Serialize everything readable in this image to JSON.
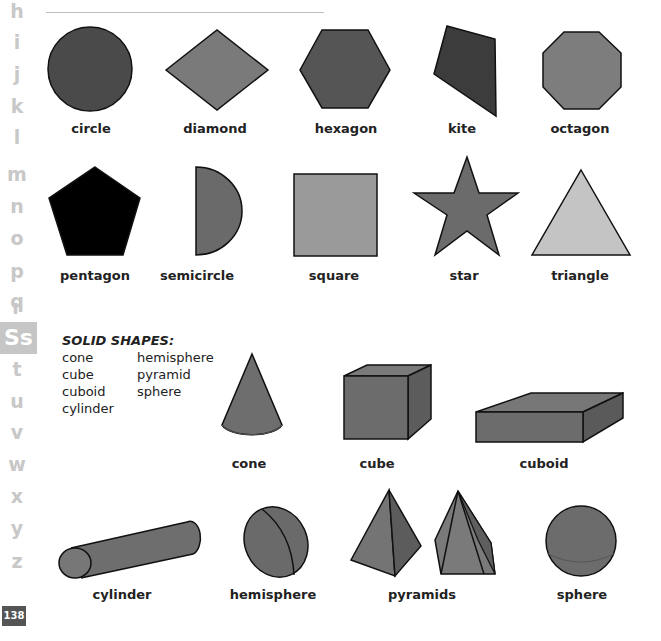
{
  "index": {
    "letters_above": [
      "h",
      "i",
      "j",
      "k",
      "l",
      "m",
      "n",
      "o",
      "p",
      "q",
      "r"
    ],
    "active": "Ss",
    "letters_below": [
      "t",
      "u",
      "v",
      "w",
      "x",
      "y",
      "z"
    ],
    "page_number": "138"
  },
  "flat_shapes": [
    {
      "name": "circle",
      "fill": "#4a4a4a"
    },
    {
      "name": "diamond",
      "fill": "#7a7a7a"
    },
    {
      "name": "hexagon",
      "fill": "#555555"
    },
    {
      "name": "kite",
      "fill": "#3c3c3c"
    },
    {
      "name": "octagon",
      "fill": "#7d7d7d"
    },
    {
      "name": "pentagon",
      "fill": "#000000"
    },
    {
      "name": "semicircle",
      "fill": "#6a6a6a"
    },
    {
      "name": "square",
      "fill": "#9a9a9a"
    },
    {
      "name": "star",
      "fill": "#6b6b6b"
    },
    {
      "name": "triangle",
      "fill": "#c4c4c4"
    }
  ],
  "solid_shapes": {
    "title": "SOLID SHAPES:",
    "list_col1": [
      "cone",
      "cube",
      "cuboid",
      "cylinder"
    ],
    "list_col2": [
      "hemisphere",
      "pyramid",
      "sphere"
    ],
    "items": [
      {
        "name": "cone"
      },
      {
        "name": "cube"
      },
      {
        "name": "cuboid"
      },
      {
        "name": "cylinder"
      },
      {
        "name": "hemisphere"
      },
      {
        "name": "pyramids"
      },
      {
        "name": "sphere"
      }
    ]
  }
}
